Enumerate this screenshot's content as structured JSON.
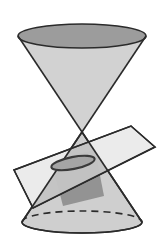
{
  "figure": {
    "title": "Conic section: plane intersecting a double cone producing an ellipse",
    "canvas": {
      "width": 164,
      "height": 241,
      "background": "#ffffff"
    }
  },
  "colors": {
    "background": "#ffffff",
    "outline": "#2b2b2b",
    "cone_upper_fill": "#d2d2d2",
    "cone_lower_fill": "#cfcfcf",
    "cone_top_cap_fill": "#9c9c9c",
    "plane_fill": "#e9e9e9",
    "plane_over_cone_fill": "#b9b9b9",
    "cone_shadow_fill": "#8f8f8f",
    "section_ellipse_fill": "#a5a5a5",
    "section_ellipse_stroke": "#3a3a3a",
    "hidden_edge_stroke": "#2b2b2b"
  },
  "geometry": {
    "apex": {
      "x": 82,
      "y": 132
    },
    "top_circle": {
      "cx": 82,
      "cy": 36,
      "rx": 64,
      "ry": 12
    },
    "bottom_circle": {
      "cx": 82,
      "cy": 222,
      "rx": 60,
      "ry": 11
    },
    "section_ellipse": {
      "cx": 73,
      "cy": 163,
      "rx": 22,
      "ry": 6,
      "rotation_deg": -11
    },
    "plane_quad": [
      {
        "x": 14,
        "y": 170
      },
      {
        "x": 131,
        "y": 126
      },
      {
        "x": 155,
        "y": 147
      },
      {
        "x": 33,
        "y": 208
      }
    ],
    "upper_nappe_path": "M 18 36 L 82 132 L 146 36",
    "lower_nappe_path": "M 82 132 L 22 222 L 142 222",
    "hidden_back_arc_dashed": true,
    "dash_pattern": "7 5"
  },
  "labels": {
    "figure_caption": "",
    "apex_label": "",
    "plane_label": "",
    "ellipse_label": ""
  },
  "elements": {
    "cone_upper_name": "upper-nappe",
    "cone_lower_name": "lower-nappe",
    "plane_name": "cutting-plane",
    "ellipse_name": "conic-section-ellipse",
    "top_cap_name": "cone-top-cap",
    "bottom_cap_name": "cone-bottom-cap"
  }
}
